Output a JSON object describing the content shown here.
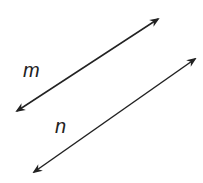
{
  "diagram": {
    "lines": [
      {
        "name": "m",
        "x1": 17,
        "y1": 111,
        "x2": 158,
        "y2": 19
      },
      {
        "name": "n",
        "x1": 34,
        "y1": 172,
        "x2": 195,
        "y2": 59
      }
    ],
    "labels": {
      "m": "m",
      "n": "n"
    },
    "color": "#222222"
  }
}
